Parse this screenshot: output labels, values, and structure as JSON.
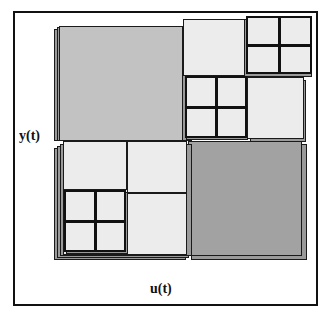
{
  "figure": {
    "kind": "recursive-partition-diagram",
    "axes": {
      "y_label": "y(t)",
      "x_label": "u(t)"
    },
    "colors": {
      "frame": "#111111",
      "background": "#ffffff",
      "gray_medium": "#c2c2c2",
      "gray_dark": "#a2a2a2",
      "gray_light": "#ececec",
      "shadow": "#9a9a9a",
      "line": "#1a1a1a"
    },
    "blocks": [
      {
        "id": "top-left-large",
        "fill": "gray_medium",
        "note": "large medium-gray cell, upper left quadrant"
      },
      {
        "id": "top-middle",
        "fill": "gray_light",
        "note": "light cell, top center"
      },
      {
        "id": "top-right-quad",
        "fill": "gray_light",
        "note": "2x2 subdivided cell, top right corner"
      },
      {
        "id": "mid-right-quad",
        "fill": "gray_light",
        "note": "2x2 subdivided cell, middle"
      },
      {
        "id": "mid-right-large",
        "fill": "gray_light",
        "note": "light cell right of middle quad"
      },
      {
        "id": "bottom-right-large",
        "fill": "gray_dark",
        "note": "large dark-gray cell, lower right quadrant"
      },
      {
        "id": "bottom-left-upper",
        "fill": "gray_light",
        "note": "light cell, lower-left upper band"
      },
      {
        "id": "bottom-left-right",
        "fill": "gray_light",
        "note": "light cell, lower-left right band"
      },
      {
        "id": "bottom-left-quad",
        "fill": "gray_light",
        "note": "2x2 subdivided cell, lower left"
      },
      {
        "id": "bottom-left-lower",
        "fill": "gray_light",
        "note": "light cell, lower-left lower band"
      }
    ]
  }
}
